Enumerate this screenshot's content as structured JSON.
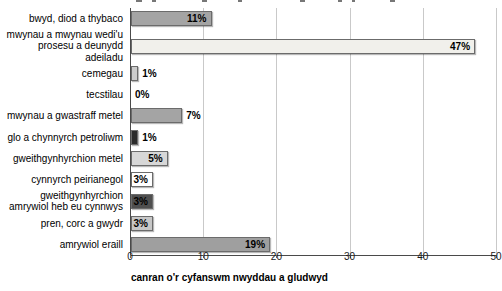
{
  "chart_data": {
    "type": "bar",
    "orientation": "horizontal",
    "categories": [
      "bwyd, diod a thybaco",
      "mwynau a mwynau wedi'u prosesu a deunydd adeiladu",
      "cemegau",
      "tecstilau",
      "mwynau a gwastraff metel",
      "glo a chynnyrch petroliwm",
      "gweithgynhyrchion metel",
      "cynnyrch peirianegol",
      "gweithgynhyrchion amrywiol heb eu cynnwys",
      "pren, corc a gwydr",
      "amrywiol eraill"
    ],
    "values": [
      11,
      47,
      1,
      0,
      7,
      1,
      5,
      3,
      3,
      3,
      19
    ],
    "value_labels": [
      "11%",
      "47%",
      "1%",
      "0%",
      "7%",
      "1%",
      "5%",
      "3%",
      "3%",
      "3%",
      "19%"
    ],
    "bar_colors": [
      "#a4a4a4",
      "#f1f0eb",
      "#cbcbcb",
      "none",
      "#a4a4a4",
      "#2b2b2b",
      "#d7d7d7",
      "#ffffff",
      "#4f4f4f",
      "#c7c7c7",
      "#9f9f9f"
    ],
    "label_inside": [
      true,
      true,
      false,
      false,
      false,
      false,
      true,
      true,
      true,
      true,
      true
    ],
    "xlabel": "canran o'r cyfanswm nwyddau a gludwyd",
    "xlim": [
      0,
      50
    ],
    "xticks": [
      0,
      10,
      20,
      30,
      40,
      50
    ],
    "grid": "vertical-gridlines-on",
    "legend": "none"
  },
  "colors": {
    "gridline": "#c9c9c9",
    "axis": "#4a4a4a",
    "text": "#000000",
    "background": "#ffffff"
  }
}
